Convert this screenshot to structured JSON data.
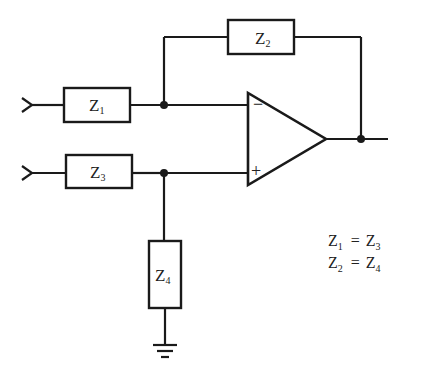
{
  "diagram": {
    "type": "circuit-schematic",
    "components": {
      "z1": {
        "label": "Z",
        "sub": "1"
      },
      "z2": {
        "label": "Z",
        "sub": "2"
      },
      "z3": {
        "label": "Z",
        "sub": "3"
      },
      "z4": {
        "label": "Z",
        "sub": "4"
      }
    },
    "opamp": {
      "inverting_label": "−",
      "noninverting_label": "+"
    },
    "conditions": [
      {
        "lhs": "Z",
        "lhs_sub": "1",
        "op": "=",
        "rhs": "Z",
        "rhs_sub": "3"
      },
      {
        "lhs": "Z",
        "lhs_sub": "2",
        "op": "=",
        "rhs": "Z",
        "rhs_sub": "4"
      }
    ],
    "colors": {
      "stroke": "#1a1a1a",
      "background": "#ffffff"
    }
  }
}
